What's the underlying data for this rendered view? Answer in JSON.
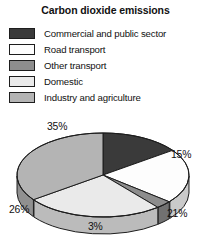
{
  "chart_data": {
    "type": "pie",
    "title": "Carbon dioxide emissions",
    "xlabel": "",
    "ylabel": "",
    "legend_position": "top",
    "grid": false,
    "categories": [
      "Commercial and public sector",
      "Road transport",
      "Other transport",
      "Domestic",
      "Industry and agriculture"
    ],
    "values": [
      15,
      21,
      3,
      26,
      35
    ],
    "value_labels": [
      "15%",
      "21%",
      "3%",
      "26%",
      "35%"
    ],
    "colors": [
      "#3a3a3a",
      "#fdfdfd",
      "#8d8d8d",
      "#eaeaea",
      "#b4b4b4"
    ],
    "slices": [
      {
        "label": "Commercial and public sector",
        "value": 15,
        "display": "15%",
        "color": "#3a3a3a"
      },
      {
        "label": "Road transport",
        "value": 21,
        "display": "21%",
        "color": "#fdfdfd"
      },
      {
        "label": "Other transport",
        "value": 3,
        "display": "3%",
        "color": "#8d8d8d"
      },
      {
        "label": "Domestic",
        "value": 26,
        "display": "26%",
        "color": "#eaeaea"
      },
      {
        "label": "Industry and agriculture",
        "value": 35,
        "display": "35%",
        "color": "#b4b4b4"
      }
    ]
  },
  "legend": {
    "items": [
      {
        "label": "Commercial and public sector",
        "color": "#3a3a3a"
      },
      {
        "label": "Road transport",
        "color": "#fdfdfd"
      },
      {
        "label": "Other transport",
        "color": "#8d8d8d"
      },
      {
        "label": "Domestic",
        "color": "#eaeaea"
      },
      {
        "label": "Industry and agriculture",
        "color": "#b4b4b4"
      }
    ]
  },
  "labels": {
    "pct_35": "35%",
    "pct_15": "15%",
    "pct_21": "21%",
    "pct_3": "3%",
    "pct_26": "26%"
  }
}
